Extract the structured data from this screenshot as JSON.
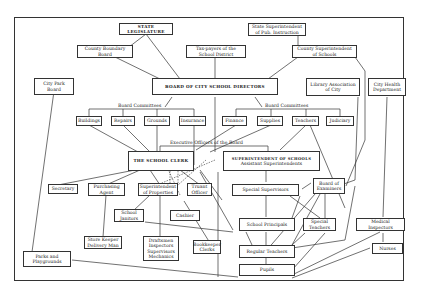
{
  "diagram": {
    "nodes": {
      "state_legislature": "STATE LEGISLATURE",
      "state_superintendent": "State Superintendent\nof Pub. Instruction",
      "county_boundary_board": "County Boundary\nBoard",
      "tax_payers": "Tax-payers of the\nSchool District",
      "county_superintendent": "County Superintendent\nof Schools",
      "city_park_board": "City Park\nBoard",
      "board_of_directors": "BOARD OF CITY SCHOOL DIRECTORS",
      "library_association": "Library Association\nof City",
      "city_health_department": "City Health\nDepartment",
      "buildings": "Buildings",
      "repairs": "Repairs",
      "grounds": "Grounds",
      "insurance": "Insurance",
      "finance": "Finance",
      "supplies": "Supplies",
      "teachers": "Teachers",
      "judiciary": "Judiciary",
      "school_clerk": "THE SCHOOL CLERK",
      "superintendent_of_schools": "SUPERINTENDENT OF SCHOOLS",
      "assistant_superintendents": "Assistant Superintendents",
      "secretary": "Secretary",
      "purchasing_agent": "Purchasing\nAgent",
      "superintendent_of_properties": "Superintendent\nof Properties",
      "truant_officer": "Truant\nOfficer",
      "board_of_examiners": "Board of\nExaminers",
      "special_supervisors": "Special Supervisors",
      "school_janitors": "School\nJanitors",
      "cashier": "Cashier",
      "school_principals": "School Principals",
      "special_teachers": "Special\nTeachers",
      "medical_inspectors": "Medical\nInspectors",
      "store_keeper": "Store Keeper\nDelivery Man",
      "draftsmen": "Draftsmen\nInspectors\nSupervisors\nMechanics",
      "bookkeeper": "Bookkeeper\nClerks",
      "regular_teachers": "Regular Teachers",
      "nurses": "Nurses",
      "parks_playgrounds": "Parks and\nPlaygrounds",
      "pupils": "Pupils"
    },
    "labels": {
      "board_committees_left": "Board   Committees",
      "board_committees_right": "Board   Committees",
      "executive_officers": "Executive   Officers   of   the   Board"
    }
  }
}
